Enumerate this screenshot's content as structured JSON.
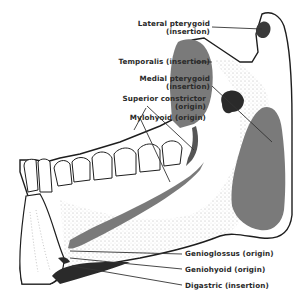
{
  "diagram": {
    "colors": {
      "muscle_area": "#7a7a7a",
      "bone_outline": "#1e1e1e",
      "stipple": "#555555",
      "background": "#ffffff",
      "leader_line": "#333333"
    },
    "labels": [
      {
        "id": "lateral-pterygoid",
        "line1": "Lateral pterygoid",
        "line2": "(insertion)"
      },
      {
        "id": "temporalis",
        "line1": "Temporalis (insertion)",
        "line2": ""
      },
      {
        "id": "medial-pterygoid",
        "line1": "Medial pterygoid",
        "line2": "(insertion)"
      },
      {
        "id": "superior-constrictor",
        "line1": "Superior constrictor",
        "line2": "(origin)"
      },
      {
        "id": "mylohyoid",
        "line1": "Mylohyoid (origin)",
        "line2": ""
      },
      {
        "id": "genioglossus",
        "line1": "Genioglossus (origin)",
        "line2": ""
      },
      {
        "id": "geniohyoid",
        "line1": "Geniohyoid (origin)",
        "line2": ""
      },
      {
        "id": "digastric",
        "line1": "Digastric (insertion)",
        "line2": ""
      }
    ]
  }
}
